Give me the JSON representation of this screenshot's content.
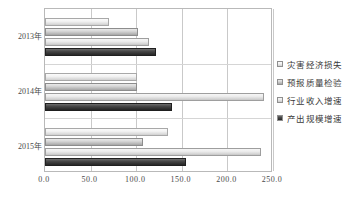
{
  "chart_data": {
    "type": "bar",
    "orientation": "horizontal",
    "title": "",
    "xlabel": "",
    "ylabel": "",
    "categories": [
      "2013年",
      "2014年",
      "2015年"
    ],
    "xticks": [
      "0.0",
      "50.0",
      "100.0",
      "150.0",
      "200.0",
      "250.0"
    ],
    "xtick_values": [
      0,
      50,
      100,
      150,
      200,
      250
    ],
    "xlim": [
      0,
      250
    ],
    "grid": true,
    "legend_position": "right",
    "series": [
      {
        "name": "灾害经济损失",
        "color": "#f2f2f2",
        "values": [
          70,
          101,
          135
        ]
      },
      {
        "name": "预报质量检验",
        "color": "#c0c0c0",
        "values": [
          102,
          101,
          107
        ]
      },
      {
        "name": "行业收入增速",
        "color": "#e2e2e2",
        "values": [
          114,
          240,
          237
        ]
      },
      {
        "name": "产出规模增速",
        "color": "#333333",
        "values": [
          122,
          139,
          155
        ]
      }
    ]
  }
}
